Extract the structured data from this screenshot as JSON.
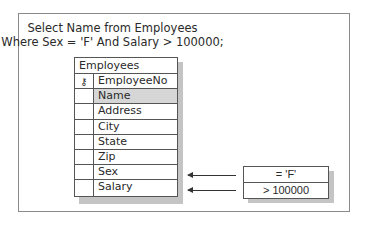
{
  "query": {
    "line1": "Select Name from Employees",
    "line2": "Where Sex = 'F' And Salary > 100000;"
  },
  "table": {
    "title": "Employees",
    "rows": [
      {
        "field": "EmployeeNo",
        "icon": "key-icon",
        "key_glyph": "⚷"
      },
      {
        "field": "Name",
        "selected": true
      },
      {
        "field": "Address"
      },
      {
        "field": "City"
      },
      {
        "field": "State"
      },
      {
        "field": "Zip"
      },
      {
        "field": "Sex"
      },
      {
        "field": "Salary"
      }
    ]
  },
  "criteria": [
    {
      "field": "Sex",
      "value": "= 'F'"
    },
    {
      "field": "Salary",
      "value": "> 100000"
    }
  ],
  "colors": {
    "border": "#555555",
    "frame": "#8a8a8a",
    "highlight": "#d6d6d6",
    "shadow": "#c4c4c4"
  }
}
